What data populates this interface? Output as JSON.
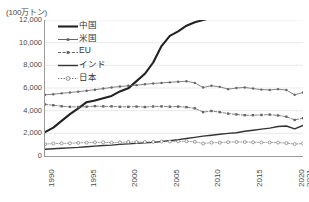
{
  "unit_label": "(100万トン)",
  "legend": {
    "items": [
      {
        "label": "中国",
        "key": "solid-thick-line",
        "color": "#222222"
      },
      {
        "label": "米国",
        "key": "line-with-dot-markers",
        "color": "#666666"
      },
      {
        "label": "EU",
        "key": "dashed-line-with-square-markers",
        "color": "#666666"
      },
      {
        "label": "インド",
        "key": "solid-medium-line",
        "color": "#333333"
      },
      {
        "label": "日本",
        "key": "dotted-line-with-open-circle-markers",
        "color": "#777777"
      }
    ]
  },
  "axes": {
    "y_ticks": [
      "12,000",
      "10,000",
      "8,000",
      "6,000",
      "4,000",
      "2,000",
      "0"
    ],
    "x_ticks": [
      "1990",
      "1995",
      "2000",
      "2005",
      "2010",
      "2015",
      "2020",
      "2021"
    ]
  },
  "chart_data": {
    "type": "line",
    "title": "",
    "subtitle": "",
    "xlabel": "",
    "ylabel": "(100万トン)",
    "ylim": [
      0,
      12000
    ],
    "xlim": [
      1990,
      2021
    ],
    "ytick_values": [
      0,
      2000,
      4000,
      6000,
      8000,
      10000,
      12000
    ],
    "xtick_values": [
      1990,
      1995,
      2000,
      2005,
      2010,
      2015,
      2020,
      2021
    ],
    "grid": "horizontal",
    "legend_position": "top-left-inside",
    "x": [
      1990,
      1991,
      1992,
      1993,
      1994,
      1995,
      1996,
      1997,
      1998,
      1999,
      2000,
      2001,
      2002,
      2003,
      2004,
      2005,
      2006,
      2007,
      2008,
      2009,
      2010,
      2011,
      2012,
      2013,
      2014,
      2015,
      2016,
      2017,
      2018,
      2019,
      2020,
      2021
    ],
    "series": [
      {
        "name": "中国",
        "style": "solid-thick",
        "color": "#222222",
        "markers": "none",
        "values": [
          2100,
          2500,
          3100,
          3700,
          4200,
          4750,
          4900,
          5100,
          5300,
          5700,
          5970,
          6610,
          7250,
          8250,
          9700,
          10600,
          11000,
          11500,
          11800,
          12000,
          12200,
          12300,
          12500,
          12600,
          12700,
          12900,
          13100,
          13300,
          13600,
          13800,
          14000,
          14400
        ]
      },
      {
        "name": "米国",
        "style": "solid-thin-markers",
        "color": "#666666",
        "markers": "dot",
        "values": [
          5400,
          5450,
          5530,
          5600,
          5680,
          5760,
          5850,
          5950,
          6050,
          6130,
          6200,
          6250,
          6330,
          6400,
          6450,
          6500,
          6550,
          6600,
          6450,
          6050,
          6200,
          6100,
          5900,
          6000,
          6050,
          5950,
          5860,
          5830,
          5900,
          5820,
          5400,
          5600
        ]
      },
      {
        "name": "EU",
        "style": "dashed-markers",
        "color": "#666666",
        "markers": "square",
        "values": [
          4550,
          4480,
          4390,
          4340,
          4330,
          4350,
          4400,
          4380,
          4380,
          4340,
          4340,
          4360,
          4320,
          4370,
          4380,
          4350,
          4360,
          4310,
          4210,
          3870,
          3970,
          3870,
          3740,
          3670,
          3600,
          3600,
          3620,
          3650,
          3580,
          3470,
          3180,
          3340
        ]
      },
      {
        "name": "インド",
        "style": "solid-medium",
        "color": "#333333",
        "markers": "none",
        "values": [
          600,
          640,
          680,
          720,
          760,
          820,
          870,
          920,
          960,
          1030,
          1070,
          1110,
          1160,
          1200,
          1280,
          1360,
          1440,
          1540,
          1640,
          1750,
          1830,
          1920,
          2000,
          2050,
          2180,
          2270,
          2370,
          2460,
          2600,
          2650,
          2400,
          2700
        ]
      },
      {
        "name": "日本",
        "style": "dotted-open-markers",
        "color": "#777777",
        "markers": "open-circle",
        "values": [
          1050,
          1100,
          1120,
          1120,
          1160,
          1180,
          1200,
          1210,
          1180,
          1200,
          1240,
          1230,
          1230,
          1250,
          1280,
          1280,
          1290,
          1300,
          1250,
          1100,
          1180,
          1180,
          1220,
          1240,
          1230,
          1210,
          1200,
          1200,
          1180,
          1140,
          1050,
          1100
        ]
      }
    ]
  }
}
